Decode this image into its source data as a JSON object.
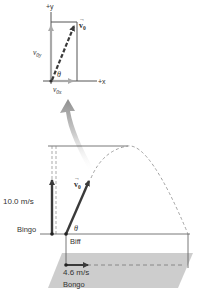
{
  "inset": {
    "y_axis_label": "+y",
    "x_axis_label": "+x",
    "v0_label": "v⃗0",
    "v0_text": "v",
    "v0_sub": "0",
    "vy_label": "v",
    "vy_sub": "0y",
    "vx_label": "v",
    "vx_sub": "0x",
    "angle_label": "θ"
  },
  "main": {
    "bingo_speed": "10.0 m/s",
    "bingo_name": "Bingo",
    "biff_name": "Biff",
    "biff_v0_text": "v",
    "biff_v0_sub": "0",
    "angle_label": "θ",
    "bongo_speed": "4.6 m/s",
    "bongo_name": "Bongo"
  },
  "colors": {
    "dark_arrow": "#3a3a3a",
    "light_arrow": "#a9a9a9",
    "line": "#555555",
    "dashed": "#8a8a8a",
    "ground_plane": "#c8c8c8",
    "big_arrow": "#9a9a9a"
  }
}
